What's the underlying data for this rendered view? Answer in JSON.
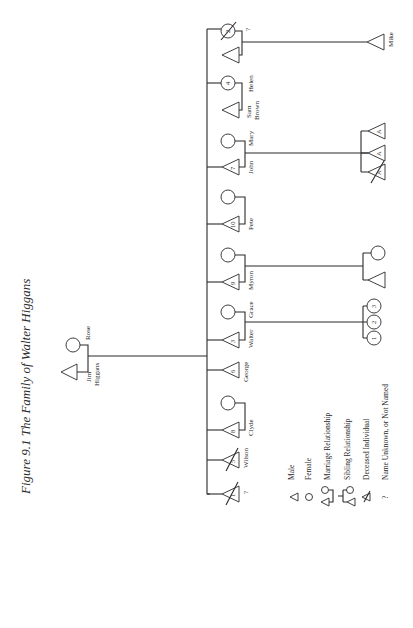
{
  "title": "Figure 9.1   The Family of Walter Higgans",
  "parents": {
    "father": {
      "name": "Jim",
      "surname": "Higgans"
    },
    "mother": {
      "name": "Rose"
    }
  },
  "siblings": [
    {
      "order": 1,
      "sex": "male",
      "number": "1",
      "name": "?",
      "deceased": true
    },
    {
      "order": 2,
      "sex": "male",
      "number": "5",
      "name": "Wilson",
      "deceased": true
    },
    {
      "order": 3,
      "sex": "male",
      "number": "8",
      "name": "Clyde",
      "spouse": "female"
    },
    {
      "order": 4,
      "sex": "male",
      "number": "6",
      "name": "George"
    },
    {
      "order": 5,
      "sex": "male",
      "number": "3",
      "name": "Walter",
      "spouse_name": "Grace",
      "children": [
        "1",
        "2",
        "3"
      ]
    },
    {
      "order": 6,
      "sex": "male",
      "number": "9",
      "name": "Myron",
      "spouse": "female",
      "children": [
        "male",
        "female"
      ]
    },
    {
      "order": 7,
      "sex": "male",
      "number": "10",
      "name": "Pete",
      "spouse": "female"
    },
    {
      "order": 8,
      "sex": "male",
      "number": "7",
      "name": "John",
      "spouse_name": "Mary",
      "children": [
        "A",
        "A",
        "A (deceased)"
      ]
    },
    {
      "order": 9,
      "sex": "female",
      "number": "4",
      "name": "Helen",
      "spouse_name_line1": "Sam",
      "spouse_name_line2": "Brown"
    },
    {
      "order": 10,
      "sex": "female",
      "number": "2",
      "name": "?",
      "deceased": true,
      "children_name": "Mike"
    }
  ],
  "labels": {
    "jim": "Jim",
    "higgans": "Higgans",
    "rose": "Rose",
    "unknown1": "?",
    "wilson": "Wilson",
    "clyde": "Clyde",
    "george": "George",
    "walter": "Walter",
    "grace": "Grace",
    "myron": "Myron",
    "pete": "Pete",
    "john": "John",
    "mary": "Mary",
    "sam": "Sam",
    "brown": "Brown",
    "helen": "Helen",
    "unknown2": "?",
    "mike": "Mike"
  },
  "numbers": {
    "n1": "1",
    "n5": "5",
    "n8": "8",
    "n6": "6",
    "n3": "3",
    "n9": "9",
    "n10": "10",
    "n7": "7",
    "n4": "4",
    "n2": "2",
    "walter_child1": "1",
    "walter_child2": "2",
    "walter_child3": "3",
    "john_child1": "A",
    "john_child2": "A",
    "john_child3": "A"
  },
  "legend": [
    {
      "symbol": "triangle",
      "label": "Male"
    },
    {
      "symbol": "circle",
      "label": "Female"
    },
    {
      "symbol": "marriage",
      "label": "Marriage Relationship"
    },
    {
      "symbol": "sibling",
      "label": "Sibling Relationship"
    },
    {
      "symbol": "deceased-triangle",
      "label": "Deceased Individual"
    },
    {
      "symbol": "question-mark",
      "glyph": "?",
      "label": "Name Unknown, or Not Named"
    }
  ]
}
